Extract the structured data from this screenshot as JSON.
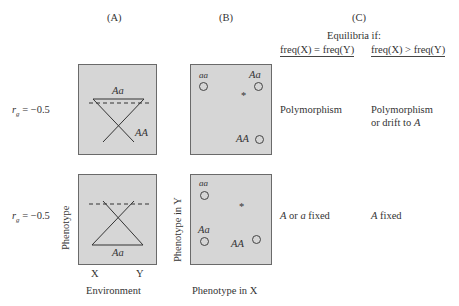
{
  "panels": {
    "a": {
      "label": "(A)"
    },
    "b": {
      "label": "(B)"
    },
    "c": {
      "label": "(C)",
      "title": "Equilibria if:",
      "col1": "freq(X) = freq(Y)",
      "col2": "freq(X) > freq(Y)"
    }
  },
  "rows": [
    {
      "rg": "r",
      "rg_sub": "g",
      "rg_value": " = −0.5",
      "a_labels": {
        "top": "Aa",
        "bottom": "AA"
      },
      "b_points": {
        "aa": "aa",
        "Aa": "Aa",
        "AA": "AA",
        "star": "*"
      },
      "c_equal": "Polymorphism",
      "c_greater_1": "Polymorphism",
      "c_greater_2_pre": "or drift to ",
      "c_greater_2_it": "A"
    },
    {
      "rg": "r",
      "rg_sub": "g",
      "rg_value": " = −0.5",
      "a_labels": {
        "bottom": "Aa"
      },
      "b_points": {
        "aa": "aa",
        "Aa": "Aa",
        "AA": "AA",
        "star": "*"
      },
      "c_equal_it1": "A",
      "c_equal_mid": " or ",
      "c_equal_it2": "a",
      "c_equal_post": " fixed",
      "c_greater_it": "A",
      "c_greater_post": " fixed"
    }
  ],
  "axes": {
    "a_y": "Phenotype",
    "a_x_ticks": [
      "X",
      "Y"
    ],
    "a_x": "Environment",
    "b_y": "Phenotype in Y",
    "b_x": "Phenotype in X"
  },
  "colors": {
    "panel_bg": "#d6d6d6",
    "panel_border": "#6a6a6a",
    "ink": "#333333"
  }
}
